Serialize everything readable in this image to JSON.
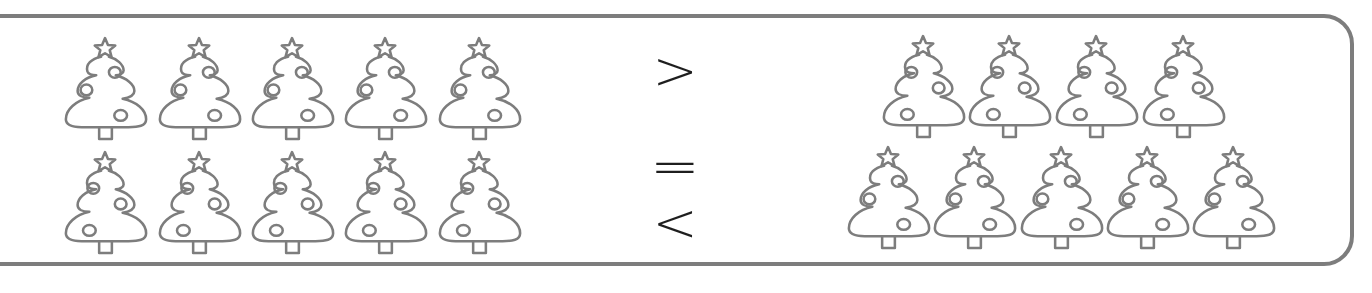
{
  "worksheet": {
    "task": "compare-quantities",
    "left_group": {
      "rows": [
        {
          "count": 5,
          "variant": "standard"
        },
        {
          "count": 5,
          "variant": "mirrored"
        }
      ],
      "total": 10
    },
    "right_group": {
      "rows": [
        {
          "count": 4,
          "variant": "mirrored"
        },
        {
          "count": 5,
          "variant": "standard"
        }
      ],
      "total": 9
    },
    "comparison_options": [
      {
        "symbol": ">",
        "name": "greater-than"
      },
      {
        "symbol": "=",
        "name": "equals"
      },
      {
        "symbol": "<",
        "name": "less-than"
      }
    ],
    "icon": "christmas-tree-icon",
    "colors": {
      "outline": "#7d7d7d",
      "symbol": "#1e1e1e",
      "background": "#ffffff"
    }
  }
}
